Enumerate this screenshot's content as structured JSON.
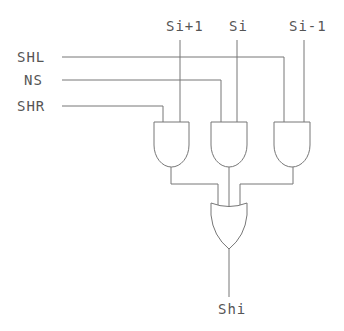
{
  "diagram": {
    "type": "logic-circuit",
    "inputs_left": {
      "shl": "SHL",
      "ns": "NS",
      "shr": "SHR"
    },
    "inputs_top": {
      "si_plus_1": "Si+1",
      "si": "Si",
      "si_minus_1": "Si-1"
    },
    "output": "Shi",
    "gates": [
      {
        "id": "and1",
        "type": "AND",
        "inputs": [
          "SHR",
          "Si+1"
        ]
      },
      {
        "id": "and2",
        "type": "AND",
        "inputs": [
          "NS",
          "Si"
        ]
      },
      {
        "id": "and3",
        "type": "AND",
        "inputs": [
          "SHL",
          "Si-1"
        ]
      },
      {
        "id": "or1",
        "type": "OR",
        "inputs": [
          "and1",
          "and2",
          "and3"
        ],
        "output": "Shi"
      }
    ],
    "colors": {
      "line": "#777777",
      "text": "#555555",
      "background": "#ffffff"
    }
  }
}
